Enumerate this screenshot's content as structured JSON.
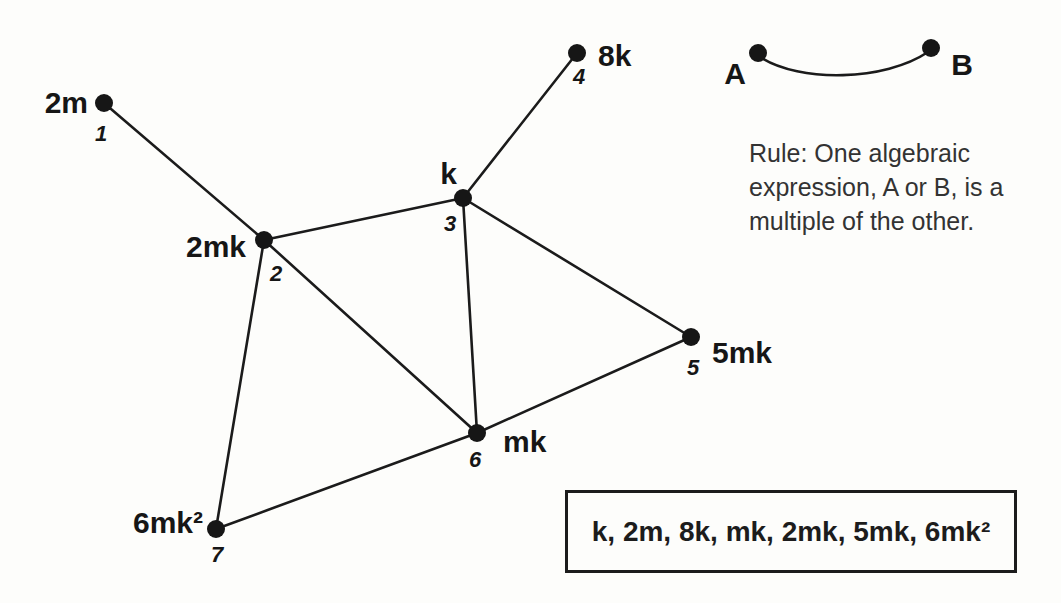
{
  "diagram": {
    "graph": {
      "nodes": [
        {
          "id": 1,
          "label": "2m",
          "number": "1"
        },
        {
          "id": 2,
          "label": "2mk",
          "number": "2"
        },
        {
          "id": 3,
          "label": "k",
          "number": "3"
        },
        {
          "id": 4,
          "label": "8k",
          "number": "4"
        },
        {
          "id": 5,
          "label": "5mk",
          "number": "5"
        },
        {
          "id": 6,
          "label": "mk",
          "number": "6"
        },
        {
          "id": 7,
          "label": "6mk²",
          "number": "7"
        }
      ],
      "edges": [
        [
          "2m",
          "2mk"
        ],
        [
          "2mk",
          "k"
        ],
        [
          "k",
          "8k"
        ],
        [
          "k",
          "5mk"
        ],
        [
          "k",
          "mk"
        ],
        [
          "2mk",
          "mk"
        ],
        [
          "2mk",
          "6mk²"
        ],
        [
          "5mk",
          "mk"
        ],
        [
          "mk",
          "6mk²"
        ]
      ]
    },
    "legend": {
      "endpoint_a": "A",
      "endpoint_b": "B"
    },
    "rule": {
      "lines": [
        "Rule: One algebraic",
        "expression, A or B, is a",
        "multiple of the other."
      ]
    },
    "expression_box": {
      "text": "k, 2m, 8k, mk, 2mk, 5mk, 6mk²"
    },
    "colors": {
      "ink": "#1b1b1b",
      "background": "#fdfdfb"
    }
  }
}
